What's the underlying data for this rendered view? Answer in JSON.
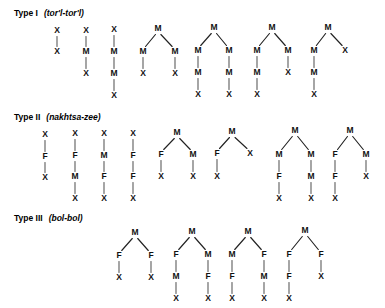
{
  "figure": {
    "width": 385,
    "height": 308,
    "background": "#ffffff",
    "ink_color": "#111111",
    "edge_color": "#222222",
    "vertical_edge_color": "#555555"
  },
  "sections": [
    {
      "id": "type-1",
      "label": "Type I",
      "gloss": "(tor'l-tor'l)",
      "label_x": 14,
      "label_y": 16,
      "trees": [
        {
          "id": "t1-1",
          "root": {
            "label": "X",
            "x": 57,
            "y": 31,
            "children": [
              {
                "label": "X",
                "x": 57,
                "y": 52,
                "children": []
              }
            ]
          }
        },
        {
          "id": "t1-2",
          "root": {
            "label": "X",
            "x": 86,
            "y": 31,
            "children": [
              {
                "label": "M",
                "x": 86,
                "y": 52,
                "children": [
                  {
                    "label": "X",
                    "x": 86,
                    "y": 74,
                    "children": []
                  }
                ]
              }
            ]
          }
        },
        {
          "id": "t1-3",
          "root": {
            "label": "X",
            "x": 114,
            "y": 30,
            "children": [
              {
                "label": "M",
                "x": 114,
                "y": 52,
                "children": [
                  {
                    "label": "M",
                    "x": 114,
                    "y": 74,
                    "children": [
                      {
                        "label": "X",
                        "x": 114,
                        "y": 96,
                        "children": []
                      }
                    ]
                  }
                ]
              }
            ]
          }
        },
        {
          "id": "t1-4",
          "root": {
            "label": "M",
            "x": 158,
            "y": 29,
            "children": [
              {
                "label": "M",
                "x": 143,
                "y": 52,
                "children": [
                  {
                    "label": "X",
                    "x": 143,
                    "y": 74,
                    "children": []
                  }
                ]
              },
              {
                "label": "M",
                "x": 175,
                "y": 52,
                "children": [
                  {
                    "label": "X",
                    "x": 175,
                    "y": 74,
                    "children": []
                  }
                ]
              }
            ]
          }
        },
        {
          "id": "t1-5",
          "root": {
            "label": "M",
            "x": 214,
            "y": 28,
            "children": [
              {
                "label": "M",
                "x": 198,
                "y": 51,
                "children": [
                  {
                    "label": "M",
                    "x": 198,
                    "y": 73,
                    "children": [
                      {
                        "label": "X",
                        "x": 198,
                        "y": 95,
                        "children": []
                      }
                    ]
                  }
                ]
              },
              {
                "label": "M",
                "x": 229,
                "y": 51,
                "children": [
                  {
                    "label": "M",
                    "x": 229,
                    "y": 73,
                    "children": [
                      {
                        "label": "X",
                        "x": 229,
                        "y": 95,
                        "children": []
                      }
                    ]
                  }
                ]
              }
            ]
          }
        },
        {
          "id": "t1-6",
          "root": {
            "label": "M",
            "x": 272,
            "y": 28,
            "children": [
              {
                "label": "M",
                "x": 257,
                "y": 51,
                "children": [
                  {
                    "label": "M",
                    "x": 257,
                    "y": 73,
                    "children": [
                      {
                        "label": "X",
                        "x": 257,
                        "y": 95,
                        "children": []
                      }
                    ]
                  }
                ]
              },
              {
                "label": "M",
                "x": 288,
                "y": 51,
                "children": [
                  {
                    "label": "X",
                    "x": 288,
                    "y": 73,
                    "children": []
                  }
                ]
              }
            ]
          }
        },
        {
          "id": "t1-7",
          "root": {
            "label": "M",
            "x": 328,
            "y": 28,
            "children": [
              {
                "label": "M",
                "x": 314,
                "y": 51,
                "children": [
                  {
                    "label": "M",
                    "x": 314,
                    "y": 73,
                    "children": [
                      {
                        "label": "X",
                        "x": 314,
                        "y": 95,
                        "children": []
                      }
                    ]
                  }
                ]
              },
              {
                "label": "X",
                "x": 345,
                "y": 51,
                "children": []
              }
            ]
          }
        }
      ]
    },
    {
      "id": "type-2",
      "label": "Type II",
      "gloss": "(nakhtsa-zee)",
      "label_x": 14,
      "label_y": 120,
      "trees": [
        {
          "id": "t2-1",
          "root": {
            "label": "X",
            "x": 45,
            "y": 135,
            "children": [
              {
                "label": "F",
                "x": 45,
                "y": 157,
                "children": [
                  {
                    "label": "X",
                    "x": 45,
                    "y": 178,
                    "children": []
                  }
                ]
              }
            ]
          }
        },
        {
          "id": "t2-2",
          "root": {
            "label": "X",
            "x": 75,
            "y": 134,
            "children": [
              {
                "label": "F",
                "x": 75,
                "y": 156,
                "children": [
                  {
                    "label": "M",
                    "x": 75,
                    "y": 177,
                    "children": [
                      {
                        "label": "X",
                        "x": 75,
                        "y": 199,
                        "children": []
                      }
                    ]
                  }
                ]
              }
            ]
          }
        },
        {
          "id": "t2-3",
          "root": {
            "label": "X",
            "x": 104,
            "y": 134,
            "children": [
              {
                "label": "M",
                "x": 104,
                "y": 156,
                "children": [
                  {
                    "label": "F",
                    "x": 104,
                    "y": 177,
                    "children": [
                      {
                        "label": "X",
                        "x": 104,
                        "y": 199,
                        "children": []
                      }
                    ]
                  }
                ]
              }
            ]
          }
        },
        {
          "id": "t2-4",
          "root": {
            "label": "X",
            "x": 133,
            "y": 134,
            "children": [
              {
                "label": "F",
                "x": 133,
                "y": 156,
                "children": [
                  {
                    "label": "F",
                    "x": 133,
                    "y": 177,
                    "children": [
                      {
                        "label": "X",
                        "x": 133,
                        "y": 199,
                        "children": []
                      }
                    ]
                  }
                ]
              }
            ]
          }
        },
        {
          "id": "t2-5",
          "root": {
            "label": "M",
            "x": 177,
            "y": 133,
            "children": [
              {
                "label": "F",
                "x": 161,
                "y": 155,
                "children": [
                  {
                    "label": "X",
                    "x": 161,
                    "y": 177,
                    "children": []
                  }
                ]
              },
              {
                "label": "M",
                "x": 193,
                "y": 155,
                "children": [
                  {
                    "label": "X",
                    "x": 193,
                    "y": 177,
                    "children": []
                  }
                ]
              }
            ]
          }
        },
        {
          "id": "t2-6",
          "root": {
            "label": "M",
            "x": 232,
            "y": 132,
            "children": [
              {
                "label": "F",
                "x": 217,
                "y": 154,
                "children": [
                  {
                    "label": "X",
                    "x": 217,
                    "y": 177,
                    "children": []
                  }
                ]
              },
              {
                "label": "X",
                "x": 250,
                "y": 154,
                "children": []
              }
            ]
          }
        },
        {
          "id": "t2-7",
          "root": {
            "label": "M",
            "x": 295,
            "y": 131,
            "children": [
              {
                "label": "M",
                "x": 279,
                "y": 155,
                "children": [
                  {
                    "label": "F",
                    "x": 279,
                    "y": 177,
                    "children": [
                      {
                        "label": "X",
                        "x": 279,
                        "y": 199,
                        "children": []
                      }
                    ]
                  }
                ]
              },
              {
                "label": "M",
                "x": 311,
                "y": 155,
                "children": [
                  {
                    "label": "M",
                    "x": 311,
                    "y": 177,
                    "children": [
                      {
                        "label": "X",
                        "x": 311,
                        "y": 199,
                        "children": []
                      }
                    ]
                  }
                ]
              }
            ]
          }
        },
        {
          "id": "t2-8",
          "root": {
            "label": "M",
            "x": 350,
            "y": 131,
            "children": [
              {
                "label": "F",
                "x": 335,
                "y": 155,
                "children": [
                  {
                    "label": "F",
                    "x": 335,
                    "y": 177,
                    "children": [
                      {
                        "label": "X",
                        "x": 335,
                        "y": 199,
                        "children": []
                      }
                    ]
                  }
                ]
              },
              {
                "label": "M",
                "x": 366,
                "y": 155,
                "children": [
                  {
                    "label": "X",
                    "x": 366,
                    "y": 177,
                    "children": []
                  }
                ]
              }
            ]
          }
        }
      ]
    },
    {
      "id": "type-3",
      "label": "Type III",
      "gloss": "(bol-bol)",
      "label_x": 14,
      "label_y": 221,
      "trees": [
        {
          "id": "t3-1",
          "root": {
            "label": "M",
            "x": 135,
            "y": 233,
            "children": [
              {
                "label": "F",
                "x": 119,
                "y": 256,
                "children": [
                  {
                    "label": "X",
                    "x": 119,
                    "y": 278,
                    "children": []
                  }
                ]
              },
              {
                "label": "F",
                "x": 151,
                "y": 256,
                "children": [
                  {
                    "label": "X",
                    "x": 151,
                    "y": 278,
                    "children": []
                  }
                ]
              }
            ]
          }
        },
        {
          "id": "t3-2",
          "root": {
            "label": "M",
            "x": 192,
            "y": 232,
            "children": [
              {
                "label": "F",
                "x": 176,
                "y": 255,
                "children": [
                  {
                    "label": "M",
                    "x": 176,
                    "y": 277,
                    "children": [
                      {
                        "label": "X",
                        "x": 176,
                        "y": 299,
                        "children": []
                      }
                    ]
                  }
                ]
              },
              {
                "label": "M",
                "x": 208,
                "y": 255,
                "children": [
                  {
                    "label": "F",
                    "x": 208,
                    "y": 277,
                    "children": [
                      {
                        "label": "X",
                        "x": 208,
                        "y": 299,
                        "children": []
                      }
                    ]
                  }
                ]
              }
            ]
          }
        },
        {
          "id": "t3-3",
          "root": {
            "label": "M",
            "x": 248,
            "y": 232,
            "children": [
              {
                "label": "M",
                "x": 232,
                "y": 255,
                "children": [
                  {
                    "label": "F",
                    "x": 232,
                    "y": 277,
                    "children": [
                      {
                        "label": "X",
                        "x": 232,
                        "y": 299,
                        "children": []
                      }
                    ]
                  }
                ]
              },
              {
                "label": "F",
                "x": 264,
                "y": 255,
                "children": [
                  {
                    "label": "M",
                    "x": 264,
                    "y": 277,
                    "children": [
                      {
                        "label": "X",
                        "x": 264,
                        "y": 299,
                        "children": []
                      }
                    ]
                  }
                ]
              }
            ]
          }
        },
        {
          "id": "t3-4",
          "root": {
            "label": "M",
            "x": 305,
            "y": 231,
            "children": [
              {
                "label": "F",
                "x": 289,
                "y": 255,
                "children": [
                  {
                    "label": "F",
                    "x": 289,
                    "y": 277,
                    "children": [
                      {
                        "label": "X",
                        "x": 289,
                        "y": 299,
                        "children": []
                      }
                    ]
                  }
                ]
              },
              {
                "label": "F",
                "x": 321,
                "y": 255,
                "children": [
                  {
                    "label": "X",
                    "x": 321,
                    "y": 277,
                    "children": []
                  }
                ]
              }
            ]
          }
        }
      ]
    }
  ]
}
